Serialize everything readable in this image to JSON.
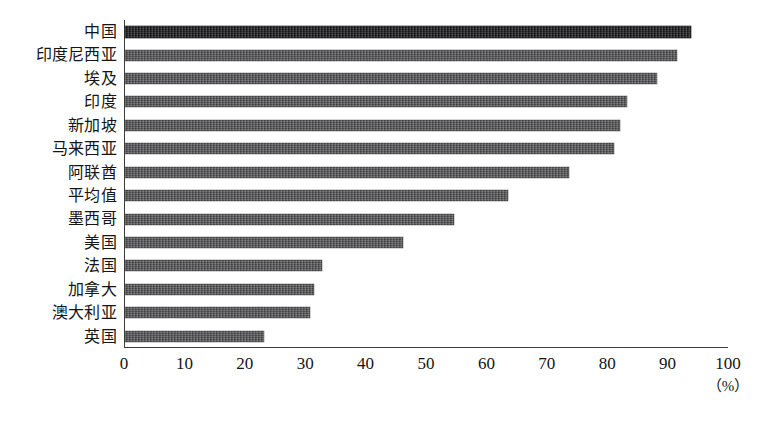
{
  "chart_data": {
    "type": "bar",
    "orientation": "horizontal",
    "title": "",
    "subtitle": "",
    "xlabel": "(%)",
    "ylabel": "",
    "xlim": [
      0,
      100
    ],
    "xticks": [
      0,
      10,
      20,
      30,
      40,
      50,
      60,
      70,
      80,
      90,
      100
    ],
    "xtick_labels": [
      "0",
      "10",
      "20",
      "30",
      "40",
      "50",
      "60",
      "70",
      "80",
      "90",
      "100"
    ],
    "grid": false,
    "legend": null,
    "categories": [
      "中国",
      "印度尼西亚",
      "埃及",
      "印度",
      "新加坡",
      "马来西亚",
      "阿联酋",
      "平均值",
      "墨西哥",
      "美国",
      "法国",
      "加拿大",
      "澳大利亚",
      "英国"
    ],
    "values": [
      93.7,
      91.4,
      88.1,
      83.1,
      82.0,
      80.9,
      73.5,
      63.4,
      54.5,
      46.0,
      32.6,
      31.3,
      30.6,
      23.0
    ],
    "bar_colors": [
      "#1c1c1e",
      "#58585a",
      "#58585a",
      "#58585a",
      "#58585a",
      "#58585a",
      "#58585a",
      "#58585a",
      "#58585a",
      "#58585a",
      "#58585a",
      "#58585a",
      "#58585a",
      "#58585a"
    ],
    "axis_color": "#3c3c3c",
    "background_color": "#ffffff"
  },
  "axis": {
    "unit_label": "（%）"
  },
  "caption": {
    "text": ""
  }
}
